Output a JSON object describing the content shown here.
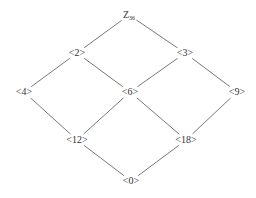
{
  "diagram": {
    "nodes": [
      {
        "id": "Z36",
        "label": "Z",
        "sub": "36",
        "x": 129,
        "y": 15
      },
      {
        "id": "2",
        "label": "<2>",
        "x": 77,
        "y": 53
      },
      {
        "id": "3",
        "label": "<3>",
        "x": 185,
        "y": 53
      },
      {
        "id": "4",
        "label": "<4>",
        "x": 24,
        "y": 92
      },
      {
        "id": "6",
        "label": "<6>",
        "x": 130,
        "y": 92
      },
      {
        "id": "9",
        "label": "<9>",
        "x": 237,
        "y": 92
      },
      {
        "id": "12",
        "label": "<12>",
        "x": 77,
        "y": 140
      },
      {
        "id": "18",
        "label": "<18>",
        "x": 186,
        "y": 140
      },
      {
        "id": "0",
        "label": "<0>",
        "x": 131,
        "y": 181
      }
    ],
    "edges": [
      [
        "Z36",
        "2"
      ],
      [
        "Z36",
        "3"
      ],
      [
        "2",
        "4"
      ],
      [
        "2",
        "6"
      ],
      [
        "3",
        "6"
      ],
      [
        "3",
        "9"
      ],
      [
        "4",
        "12"
      ],
      [
        "6",
        "12"
      ],
      [
        "6",
        "18"
      ],
      [
        "9",
        "18"
      ],
      [
        "12",
        "0"
      ],
      [
        "18",
        "0"
      ]
    ],
    "line_color": "#555555"
  }
}
